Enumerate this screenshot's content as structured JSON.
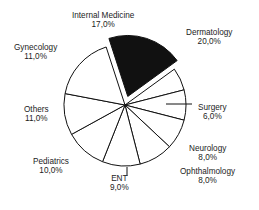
{
  "chart_data": {
    "type": "pie",
    "title": "",
    "subtitle": "",
    "xlabel": "",
    "ylabel": "",
    "legend_position": "none",
    "grid": false,
    "value_suffix": "%",
    "decimal_separator": ",",
    "start_angle_deg": -18,
    "direction": "clockwise",
    "exploded_slice": "Dermatology",
    "categories": [
      "Dermatology",
      "Surgery",
      "Neurology",
      "Ophthalmology",
      "ENT",
      "Pediatrics",
      "Others",
      "Gynecology",
      "Internal Medicine"
    ],
    "values": [
      20.0,
      6.0,
      8.0,
      8.0,
      9.0,
      10.0,
      11.0,
      11.0,
      17.0
    ],
    "slices": [
      {
        "name": "Dermatology",
        "label": "Dermatology",
        "value": 20.0,
        "value_text": "20,0%",
        "color": "#111111",
        "exploded": true,
        "label_x": 186,
        "label_y": 28
      },
      {
        "name": "Surgery",
        "label": "Surgery",
        "value": 6.0,
        "value_text": "6,0%",
        "color": "#ffffff",
        "exploded": false,
        "label_x": 198,
        "label_y": 103
      },
      {
        "name": "Neurology",
        "label": "Neurology",
        "value": 8.0,
        "value_text": "8,0%",
        "color": "#ffffff",
        "exploded": false,
        "label_x": 189,
        "label_y": 144
      },
      {
        "name": "Ophthalmology",
        "label": "Ophthalmology",
        "value": 8.0,
        "value_text": "8,0%",
        "color": "#ffffff",
        "exploded": false,
        "label_x": 180,
        "label_y": 167
      },
      {
        "name": "ENT",
        "label": "ENT",
        "value": 9.0,
        "value_text": "9,0%",
        "color": "#ffffff",
        "exploded": false,
        "label_x": 110,
        "label_y": 174
      },
      {
        "name": "Pediatrics",
        "label": "Pediatrics",
        "value": 10.0,
        "value_text": "10,0%",
        "color": "#ffffff",
        "exploded": false,
        "label_x": 33,
        "label_y": 157
      },
      {
        "name": "Others",
        "label": "Others",
        "value": 11.0,
        "value_text": "11,0%",
        "color": "#ffffff",
        "exploded": false,
        "label_x": 24,
        "label_y": 105
      },
      {
        "name": "Gynecology",
        "label": "Gynecology",
        "value": 11.0,
        "value_text": "11,0%",
        "color": "#ffffff",
        "exploded": false,
        "label_x": 14,
        "label_y": 43
      },
      {
        "name": "Internal Medicine",
        "label": "Internal Medicine",
        "value": 17.0,
        "value_text": "17,0%",
        "color": "#ffffff",
        "exploded": false,
        "label_x": 72,
        "label_y": 11
      }
    ]
  }
}
